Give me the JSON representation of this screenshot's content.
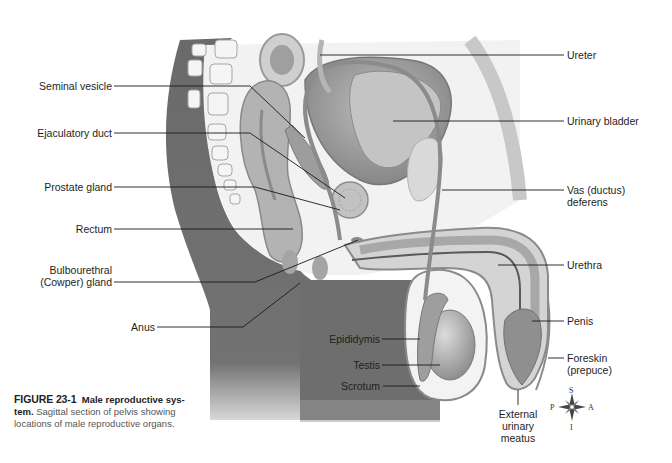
{
  "figure": {
    "number": "FIGURE 23-1",
    "title_part1": "Male reproductive sys-",
    "title_part2": "tem.",
    "description_line1": " Sagittal section of pelvis showing",
    "description_line2": "locations of male reproductive organs."
  },
  "labels_left": [
    {
      "id": "seminal-vesicle",
      "text": "Seminal vesicle"
    },
    {
      "id": "ejaculatory-duct",
      "text": "Ejaculatory duct"
    },
    {
      "id": "prostate-gland",
      "text": "Prostate gland"
    },
    {
      "id": "rectum",
      "text": "Rectum"
    },
    {
      "id": "bulbourethral-gland",
      "line1": "Bulbourethral",
      "line2": "(Cowper) gland"
    },
    {
      "id": "anus",
      "text": "Anus"
    }
  ],
  "labels_right": [
    {
      "id": "ureter",
      "text": "Ureter"
    },
    {
      "id": "urinary-bladder",
      "text": "Urinary bladder"
    },
    {
      "id": "vas-deferens",
      "line1": "Vas (ductus)",
      "line2": "deferens"
    },
    {
      "id": "urethra",
      "text": "Urethra"
    },
    {
      "id": "penis",
      "text": "Penis"
    },
    {
      "id": "foreskin",
      "line1": "Foreskin",
      "line2": "(prepuce)"
    }
  ],
  "labels_center": [
    {
      "id": "epididymis",
      "text": "Epididymis"
    },
    {
      "id": "testis",
      "text": "Testis"
    },
    {
      "id": "scrotum",
      "text": "Scrotum"
    },
    {
      "id": "external-urinary-meatus",
      "line1": "External",
      "line2": "urinary",
      "line3": "meatus"
    }
  ],
  "compass": {
    "superior": "S",
    "inferior": "I",
    "posterior": "P",
    "anterior": "A"
  },
  "colors": {
    "body_dark": "#6f6f6f",
    "organ_mid": "#a9a9a9",
    "organ_light": "#d6d6d6",
    "leader_line": "#1a1a1a"
  }
}
